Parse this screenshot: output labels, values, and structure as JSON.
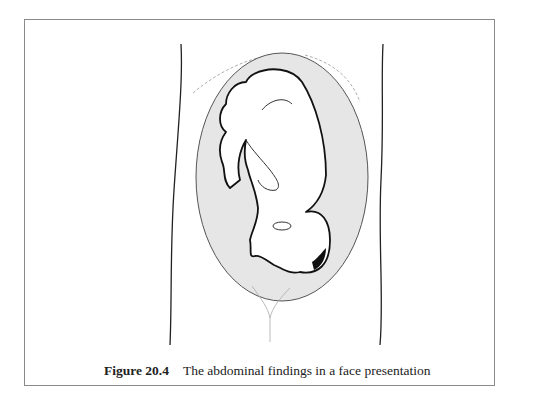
{
  "figure": {
    "label": "Figure 20.4",
    "caption": "The abdominal findings in a face presentation",
    "illustration": "abdomen-outline-with-uterus-and-fetus-in-face-presentation",
    "colors": {
      "frame": "#8a8a8a",
      "uterus_fill": "#e6e6e6",
      "outline": "#111111"
    }
  }
}
